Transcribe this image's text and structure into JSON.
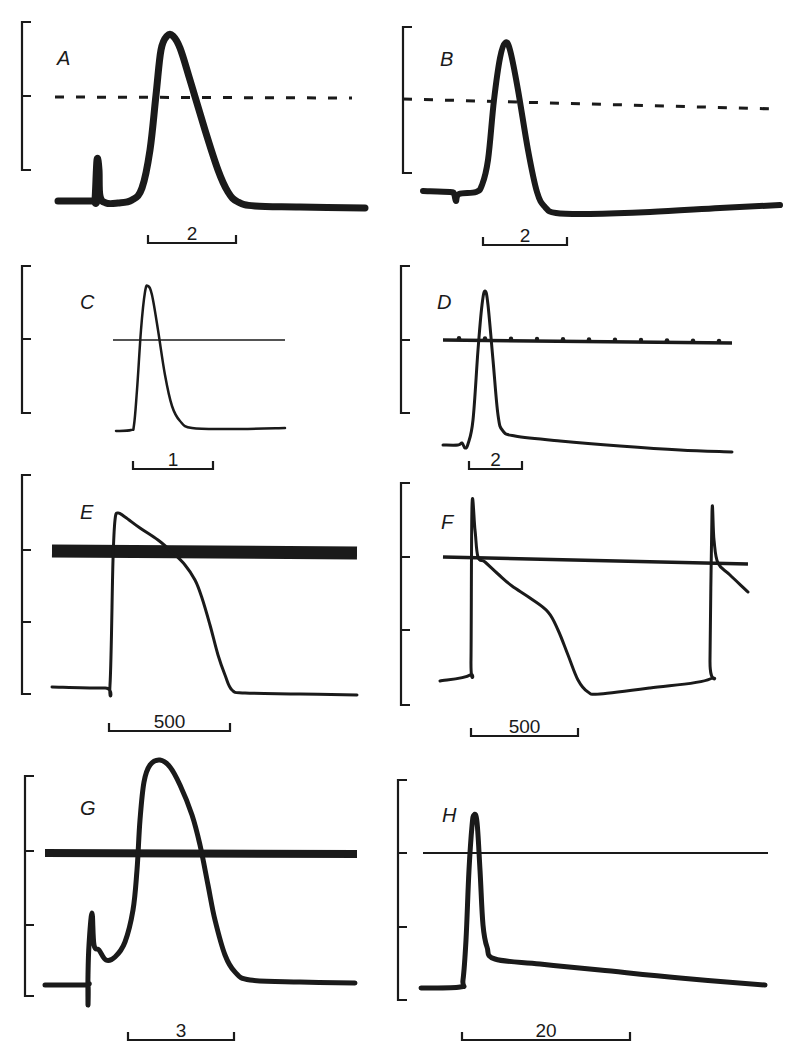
{
  "figure": {
    "panels": [
      {
        "id": "A",
        "label": "A",
        "scale_label": "2",
        "bracket": {
          "x": 22,
          "y0": 22,
          "y1": 170,
          "ticks": [
            96
          ]
        },
        "reference_line": {
          "style": "dashed",
          "width": 3,
          "points": [
            [
              55,
              97
            ],
            [
              352,
              98
            ]
          ]
        },
        "trace_width": 7,
        "trace": [
          [
            58,
            201
          ],
          [
            93,
            201
          ],
          [
            95,
            200
          ],
          [
            97,
            160
          ],
          [
            99,
            170
          ],
          [
            100,
            196
          ],
          [
            106,
            203
          ],
          [
            118,
            203
          ],
          [
            132,
            200
          ],
          [
            142,
            188
          ],
          [
            150,
            150
          ],
          [
            156,
            95
          ],
          [
            161,
            50
          ],
          [
            167,
            36
          ],
          [
            173,
            36
          ],
          [
            180,
            48
          ],
          [
            190,
            80
          ],
          [
            205,
            130
          ],
          [
            218,
            170
          ],
          [
            228,
            192
          ],
          [
            238,
            202
          ],
          [
            255,
            206
          ],
          [
            300,
            207
          ],
          [
            365,
            208
          ]
        ],
        "scale_bar": {
          "x0": 148,
          "x1": 236,
          "y": 243
        }
      },
      {
        "id": "B",
        "label": "B",
        "scale_label": "2",
        "bracket": {
          "x": 403,
          "y0": 27,
          "y1": 173,
          "ticks": [
            99
          ]
        },
        "reference_line": {
          "style": "dashed",
          "width": 3,
          "points": [
            [
              403,
              99
            ],
            [
              776,
              109
            ]
          ]
        },
        "trace_width": 6,
        "trace": [
          [
            423,
            191
          ],
          [
            450,
            192
          ],
          [
            454,
            194
          ],
          [
            456,
            201
          ],
          [
            459,
            194
          ],
          [
            476,
            192
          ],
          [
            482,
            185
          ],
          [
            488,
            160
          ],
          [
            494,
            100
          ],
          [
            500,
            58
          ],
          [
            505,
            43
          ],
          [
            510,
            50
          ],
          [
            518,
            90
          ],
          [
            528,
            150
          ],
          [
            537,
            192
          ],
          [
            545,
            207
          ],
          [
            556,
            213
          ],
          [
            590,
            214
          ],
          [
            650,
            212
          ],
          [
            720,
            208
          ],
          [
            780,
            205
          ]
        ],
        "scale_bar": {
          "x0": 483,
          "x1": 567,
          "y": 245
        }
      },
      {
        "id": "C",
        "label": "C",
        "scale_label": "1",
        "bracket": {
          "x": 22,
          "y0": 266,
          "y1": 413,
          "ticks": [
            339
          ]
        },
        "reference_line": {
          "style": "solid",
          "width": 1.5,
          "points": [
            [
              113,
              340
            ],
            [
              285,
              340
            ]
          ]
        },
        "trace_width": 2.5,
        "trace": [
          [
            116,
            431
          ],
          [
            131,
            430
          ],
          [
            134,
            425
          ],
          [
            137,
            390
          ],
          [
            141,
            330
          ],
          [
            145,
            292
          ],
          [
            148,
            286
          ],
          [
            152,
            295
          ],
          [
            158,
            330
          ],
          [
            165,
            375
          ],
          [
            172,
            406
          ],
          [
            180,
            421
          ],
          [
            192,
            428
          ],
          [
            230,
            429
          ],
          [
            285,
            428
          ]
        ],
        "scale_bar": {
          "x0": 133,
          "x1": 213,
          "y": 469
        }
      },
      {
        "id": "D",
        "label": "D",
        "scale_label": "2",
        "bracket": {
          "x": 401,
          "y0": 266,
          "y1": 413,
          "ticks": [
            340
          ]
        },
        "reference_line": {
          "style": "dotted-ticks",
          "width": 3.5,
          "points": [
            [
              443,
              340
            ],
            [
              732,
              343
            ]
          ],
          "tick_spacing": 26
        },
        "trace_width": 3,
        "trace": [
          [
            443,
            445
          ],
          [
            458,
            445
          ],
          [
            462,
            443
          ],
          [
            465,
            448
          ],
          [
            468,
            444
          ],
          [
            473,
            420
          ],
          [
            478,
            350
          ],
          [
            482,
            305
          ],
          [
            485,
            291
          ],
          [
            488,
            305
          ],
          [
            493,
            360
          ],
          [
            498,
            415
          ],
          [
            503,
            431
          ],
          [
            515,
            436
          ],
          [
            560,
            441
          ],
          [
            620,
            446
          ],
          [
            680,
            450
          ],
          [
            732,
            452
          ]
        ],
        "scale_bar": {
          "x0": 469,
          "x1": 522,
          "y": 469
        }
      },
      {
        "id": "E",
        "label": "E",
        "scale_label": "500",
        "bracket": {
          "x": 22,
          "y0": 475,
          "y1": 694,
          "ticks": [
            550,
            622
          ]
        },
        "reference_line": {
          "style": "solid",
          "width": 13,
          "points": [
            [
              52,
              551
            ],
            [
              357,
              553
            ]
          ]
        },
        "trace_width": 3,
        "trace": [
          [
            52,
            687
          ],
          [
            105,
            688
          ],
          [
            110,
            685
          ],
          [
            113,
            560
          ],
          [
            115,
            520
          ],
          [
            118,
            513
          ],
          [
            125,
            517
          ],
          [
            140,
            528
          ],
          [
            158,
            540
          ],
          [
            172,
            552
          ],
          [
            185,
            565
          ],
          [
            195,
            580
          ],
          [
            202,
            598
          ],
          [
            210,
            625
          ],
          [
            218,
            655
          ],
          [
            225,
            675
          ],
          [
            232,
            690
          ],
          [
            245,
            693
          ],
          [
            300,
            694
          ],
          [
            357,
            695
          ]
        ],
        "scale_bar": {
          "x0": 109,
          "x1": 230,
          "y": 731
        }
      },
      {
        "id": "F",
        "label": "F",
        "scale_label": "500",
        "bracket": {
          "x": 401,
          "y0": 483,
          "y1": 705,
          "ticks": [
            557,
            630
          ]
        },
        "reference_line": {
          "style": "solid",
          "width": 3.5,
          "points": [
            [
              443,
              557
            ],
            [
              748,
              564
            ]
          ]
        },
        "trace_width": 3,
        "trace": [
          [
            440,
            681
          ],
          [
            470,
            675
          ],
          [
            471,
            660
          ],
          [
            472,
            506
          ],
          [
            475,
            530
          ],
          [
            478,
            557
          ],
          [
            485,
            562
          ],
          [
            498,
            574
          ],
          [
            512,
            586
          ],
          [
            530,
            598
          ],
          [
            548,
            612
          ],
          [
            558,
            630
          ],
          [
            568,
            655
          ],
          [
            578,
            680
          ],
          [
            588,
            692
          ],
          [
            600,
            694
          ],
          [
            650,
            688
          ],
          [
            710,
            679
          ],
          [
            710,
            660
          ],
          [
            712,
            512
          ],
          [
            714,
            540
          ],
          [
            718,
            563
          ],
          [
            730,
            575
          ],
          [
            748,
            592
          ]
        ],
        "scale_bar": {
          "x0": 471,
          "x1": 578,
          "y": 736
        }
      },
      {
        "id": "G",
        "label": "G",
        "scale_label": "3",
        "bracket": {
          "x": 25,
          "y0": 776,
          "y1": 996,
          "ticks": [
            851,
            925
          ]
        },
        "reference_line": {
          "style": "solid",
          "width": 8,
          "points": [
            [
              45,
              853
            ],
            [
              357,
              854
            ]
          ]
        },
        "trace_width": 5,
        "trace": [
          [
            45,
            985
          ],
          [
            85,
            985
          ],
          [
            88,
            985
          ],
          [
            88,
            1005
          ],
          [
            88,
            975
          ],
          [
            89,
            945
          ],
          [
            92,
            913
          ],
          [
            94,
            945
          ],
          [
            99,
            950
          ],
          [
            106,
            960
          ],
          [
            115,
            957
          ],
          [
            125,
            942
          ],
          [
            133,
            910
          ],
          [
            137,
            870
          ],
          [
            140,
            820
          ],
          [
            144,
            782
          ],
          [
            150,
            765
          ],
          [
            160,
            760
          ],
          [
            170,
            767
          ],
          [
            180,
            785
          ],
          [
            192,
            815
          ],
          [
            200,
            845
          ],
          [
            208,
            885
          ],
          [
            215,
            920
          ],
          [
            225,
            955
          ],
          [
            235,
            972
          ],
          [
            250,
            980
          ],
          [
            300,
            982
          ],
          [
            355,
            983
          ]
        ],
        "scale_bar": {
          "x0": 128,
          "x1": 234,
          "y": 1040
        }
      },
      {
        "id": "H",
        "label": "H",
        "scale_label": "20",
        "bracket": {
          "x": 398,
          "y0": 780,
          "y1": 1000,
          "ticks": [
            853,
            927
          ]
        },
        "reference_line": {
          "style": "solid",
          "width": 1.8,
          "points": [
            [
              423,
              853
            ],
            [
              768,
              853
            ]
          ]
        },
        "trace_width": 5,
        "trace": [
          [
            421,
            988
          ],
          [
            460,
            987
          ],
          [
            463,
            980
          ],
          [
            466,
            940
          ],
          [
            469,
            870
          ],
          [
            472,
            826
          ],
          [
            474,
            815
          ],
          [
            477,
            822
          ],
          [
            480,
            870
          ],
          [
            483,
            925
          ],
          [
            487,
            947
          ],
          [
            495,
            959
          ],
          [
            540,
            964
          ],
          [
            600,
            970
          ],
          [
            680,
            978
          ],
          [
            765,
            985
          ]
        ],
        "scale_bar": {
          "x0": 462,
          "x1": 630,
          "y": 1040
        }
      }
    ]
  },
  "chart_data": {
    "type": "line",
    "title": "",
    "legend": [],
    "panels": [
      {
        "label": "A",
        "time_scale_bar": "2",
        "reference_line": "dashed",
        "peak_relative_to_reference": "above",
        "stimulus_artifact": true
      },
      {
        "label": "B",
        "time_scale_bar": "2",
        "reference_line": "dashed",
        "peak_relative_to_reference": "above",
        "stimulus_artifact": true
      },
      {
        "label": "C",
        "time_scale_bar": "1",
        "reference_line": "solid",
        "peak_relative_to_reference": "above"
      },
      {
        "label": "D",
        "time_scale_bar": "2",
        "reference_line": "solid with time markers",
        "peak_relative_to_reference": "above"
      },
      {
        "label": "E",
        "time_scale_bar": "500",
        "reference_line": "solid thick",
        "shape": "plateau action potential"
      },
      {
        "label": "F",
        "time_scale_bar": "500",
        "reference_line": "solid",
        "shape": "pacemaker action potential, two spikes"
      },
      {
        "label": "G",
        "time_scale_bar": "3",
        "reference_line": "solid thick",
        "shape": "broad action potential with stimulus artifact"
      },
      {
        "label": "H",
        "time_scale_bar": "20",
        "reference_line": "solid",
        "shape": "spike followed by slow after-hyperpolarization"
      }
    ]
  }
}
